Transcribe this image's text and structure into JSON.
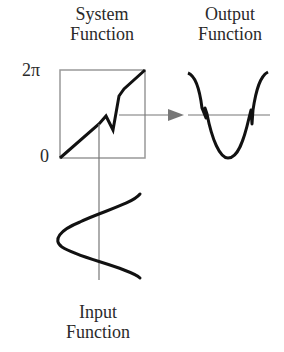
{
  "diagram": {
    "system_function": {
      "title_line1": "System",
      "title_line2": "Function",
      "y_max_label": "2π",
      "y_min_label": "0"
    },
    "output_function": {
      "title_line1": "Output",
      "title_line2": "Function"
    },
    "input_function": {
      "title_line1": "Input",
      "title_line2": "Function"
    },
    "colors": {
      "curve": "#111111",
      "axis": "#777777",
      "box": "#999999",
      "text": "#2a2a2a"
    }
  }
}
